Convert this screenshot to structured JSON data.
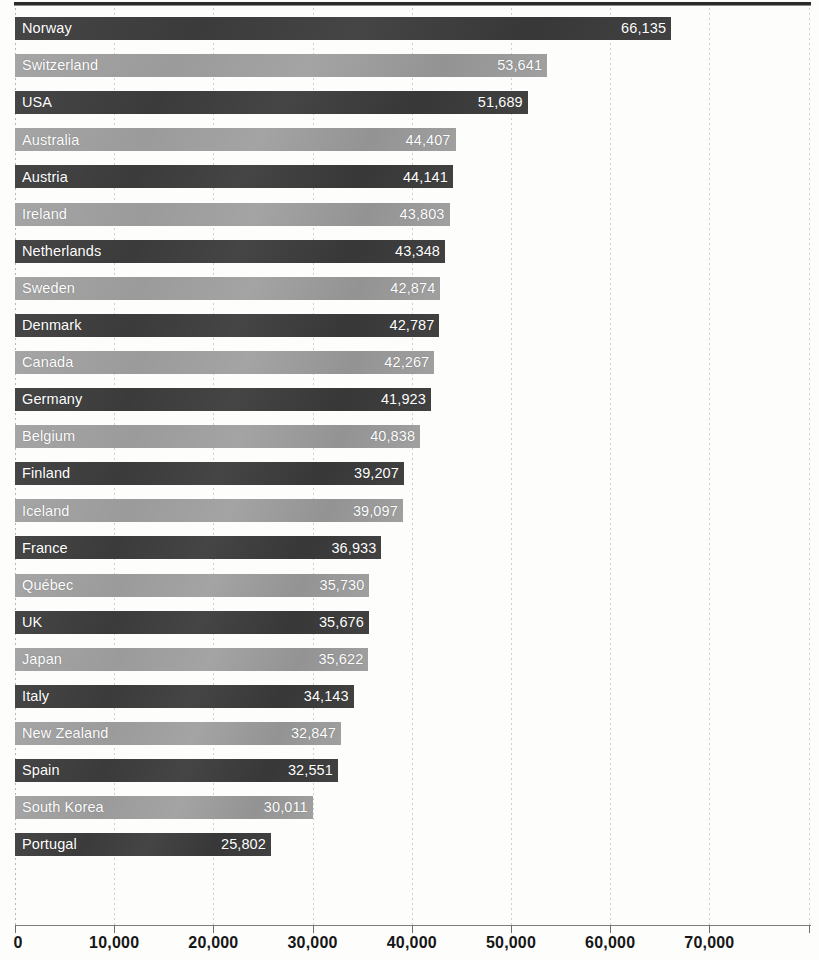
{
  "chart_data": {
    "type": "bar",
    "orientation": "horizontal",
    "title": "",
    "xlabel": "",
    "ylabel": "",
    "xlim": [
      0,
      80000
    ],
    "grid": true,
    "legend": "none",
    "tick_labels": [
      "0",
      "10,000",
      "20,000",
      "30,000",
      "40,000",
      "50,000",
      "60,000",
      "70,000"
    ],
    "tick_values": [
      0,
      10000,
      20000,
      30000,
      40000,
      50000,
      60000,
      70000
    ],
    "categories": [
      "Norway",
      "Switzerland",
      "USA",
      "Australia",
      "Austria",
      "Ireland",
      "Netherlands",
      "Sweden",
      "Denmark",
      "Canada",
      "Germany",
      "Belgium",
      "Finland",
      "Iceland",
      "France",
      "Québec",
      "UK",
      "Japan",
      "Italy",
      "New Zealand",
      "Spain",
      "South Korea",
      "Portugal"
    ],
    "values": [
      66135,
      53641,
      51689,
      44407,
      44141,
      43803,
      43348,
      42874,
      42787,
      42267,
      41923,
      40838,
      39207,
      39097,
      36933,
      35730,
      35676,
      35622,
      34143,
      32847,
      32551,
      30011,
      25802
    ],
    "value_labels": [
      "66,135",
      "53,641",
      "51,689",
      "44,407",
      "44,141",
      "43,803",
      "43,348",
      "42,874",
      "42,787",
      "42,267",
      "41,923",
      "40,838",
      "39,207",
      "39,097",
      "36,933",
      "35,730",
      "35,676",
      "35,622",
      "34,143",
      "32,847",
      "32,551",
      "30,011",
      "25,802"
    ],
    "bar_shades": [
      "dark",
      "light",
      "dark",
      "light",
      "dark",
      "light",
      "dark",
      "light",
      "dark",
      "light",
      "dark",
      "light",
      "dark",
      "light",
      "dark",
      "light",
      "dark",
      "light",
      "dark",
      "light",
      "dark",
      "light",
      "dark"
    ],
    "colors": {
      "dark_bar": "#3b3b3b",
      "light_bar": "#9b9b9b",
      "bar_text": "#ffffff",
      "axis": "#7d7d7d",
      "gridline": "#bfbfbf",
      "rule": "#2b2b2b",
      "background": "#fdfdfc"
    }
  }
}
